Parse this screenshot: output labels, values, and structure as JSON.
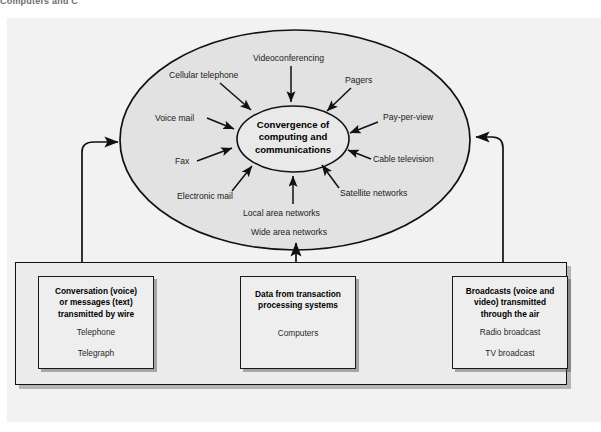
{
  "figure": {
    "top_cropped_text": "Computers and C",
    "background_color": "#f2f2f2",
    "panel_color": "#ebebeb"
  },
  "core": {
    "line1": "Convergence of",
    "line2": "computing and",
    "line3": "communications"
  },
  "contributors": [
    {
      "label": "Videoconferencing",
      "x": 253,
      "y": 57,
      "anchor": "top"
    },
    {
      "label": "Cellular telephone",
      "x": 169,
      "y": 74,
      "anchor": "top-left"
    },
    {
      "label": "Pagers",
      "x": 345,
      "y": 79,
      "anchor": "top-right"
    },
    {
      "label": "Voice mail",
      "x": 155,
      "y": 113,
      "anchor": "left"
    },
    {
      "label": "Pay-per-view",
      "x": 383,
      "y": 117,
      "anchor": "right"
    },
    {
      "label": "Fax",
      "x": 175,
      "y": 156,
      "anchor": "left"
    },
    {
      "label": "Cable television",
      "x": 373,
      "y": 155,
      "anchor": "right"
    },
    {
      "label": "Electronic mail",
      "x": 177,
      "y": 195,
      "anchor": "bottom-left"
    },
    {
      "label": "Satellite networks",
      "x": 340,
      "y": 192,
      "anchor": "bottom-right"
    },
    {
      "label": "Local area networks",
      "x": 243,
      "y": 212,
      "anchor": "bottom"
    },
    {
      "label": "Wide area networks",
      "x": 251,
      "y": 231,
      "anchor": "bottom"
    }
  ],
  "source_boxes": [
    {
      "id": "wire",
      "head": [
        "Conversation (voice)",
        "or messages (text)",
        "transmitted by wire"
      ],
      "items": [
        "Telephone",
        "Telegraph"
      ],
      "x": 38,
      "y": 276,
      "w": 116,
      "h": 93
    },
    {
      "id": "transaction",
      "head": [
        "Data from transaction",
        "processing systems"
      ],
      "items": [
        "Computers"
      ],
      "x": 240,
      "y": 276,
      "w": 116,
      "h": 93
    },
    {
      "id": "broadcast",
      "head": [
        "Broadcasts (voice and",
        "video) transmitted",
        "through the air"
      ],
      "items": [
        "Radio broadcast",
        "TV broadcast"
      ],
      "x": 452,
      "y": 276,
      "w": 116,
      "h": 93
    }
  ],
  "connectors": [
    {
      "id": "left-feed",
      "from": "wire",
      "to": "ellipse-left"
    },
    {
      "id": "middle-feed",
      "from": "transaction",
      "to": "ellipse-bottom"
    },
    {
      "id": "right-feed",
      "from": "broadcast",
      "to": "ellipse-right"
    }
  ],
  "colors": {
    "outline": "#111111",
    "ellipse_outer_fill": "#e2e2e2",
    "ellipse_inner_fill": "#e8e8e8",
    "box_fill": "#eeeeee",
    "panel_fill": "#ebebeb"
  }
}
